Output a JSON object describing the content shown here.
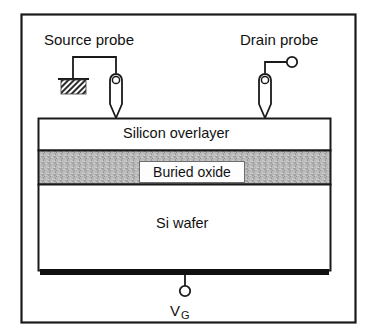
{
  "figure": {
    "border_color": "#1a1a1a",
    "background": "#ffffff"
  },
  "probes": {
    "source": {
      "label": "Source probe",
      "terminal_type": "ground-symbol",
      "name": "source-probe"
    },
    "drain": {
      "label": "Drain probe",
      "terminal_type": "open-circle",
      "name": "drain-probe"
    }
  },
  "layers": [
    {
      "label": "Silicon overlayer",
      "name": "silicon-overlayer",
      "fill": "#ffffff"
    },
    {
      "label": "Buried oxide",
      "name": "buried-oxide",
      "fill": "#b4b4b4"
    },
    {
      "label": "Si wafer",
      "name": "si-wafer",
      "fill": "#ffffff"
    }
  ],
  "back_contact": {
    "name": "back-gate-contact",
    "fill": "#111111"
  },
  "gate": {
    "symbol": "V",
    "subscript": "G",
    "terminal_type": "open-circle"
  }
}
